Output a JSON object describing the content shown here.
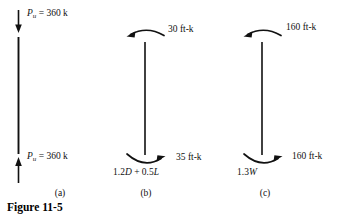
{
  "figure": {
    "title": "Figure 11-5",
    "background_color": "#ffffff",
    "ink_color": "#111111"
  },
  "panels": [
    {
      "id": "a",
      "caption": "(a)",
      "kind": "axial-load-column",
      "top_label": "P_u = 360 k",
      "top_label_value": "= 360 k",
      "top_label_symbol": "P",
      "top_label_subscript": "u",
      "bottom_label_value": "= 360 k",
      "bottom_label_symbol": "P",
      "bottom_label_subscript": "u",
      "top_arrow_direction": "down",
      "bottom_arrow_direction": "up",
      "load_combination": ""
    },
    {
      "id": "b",
      "caption": "(b)",
      "kind": "moment-column",
      "top_moment": "30 ft-k",
      "bottom_moment": "35 ft-k",
      "top_arrow_direction": "counterclockwise",
      "bottom_arrow_direction": "clockwise",
      "load_combination_prefix": "1.2",
      "load_combination_d": "D",
      "load_combination_mid": " + 0.5",
      "load_combination_l": "L"
    },
    {
      "id": "c",
      "caption": "(c)",
      "kind": "moment-column",
      "top_moment": "160 ft-k",
      "bottom_moment": "160 ft-k",
      "top_arrow_direction": "counterclockwise",
      "bottom_arrow_direction": "clockwise",
      "load_combination_prefix": "1.3",
      "load_combination_w": "W"
    }
  ]
}
